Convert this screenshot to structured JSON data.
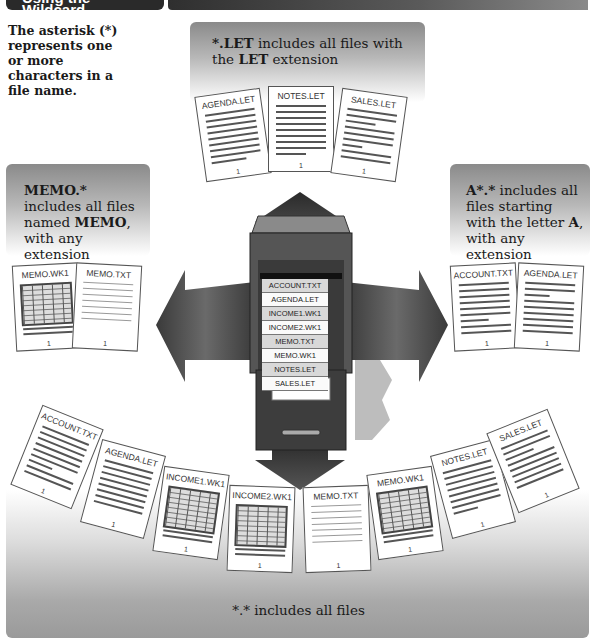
{
  "header": {
    "title": "Using the * Wildcard"
  },
  "intro": {
    "text": "The asterisk (*) represents one or more characters in a file name."
  },
  "callouts": {
    "top": {
      "bold1": "*.LET",
      "rest1": " includes all files with the ",
      "bold2": "LET",
      "rest2": " extension"
    },
    "left": {
      "bold1": "MEMO.*",
      "rest1": " includes all files named ",
      "bold2": "MEMO",
      "rest2": ", with any extension"
    },
    "right": {
      "bold1": "A*.*",
      "rest1": " includes all files starting with the letter ",
      "bold2": "A",
      "rest2": ", with any extension"
    },
    "bottom": {
      "text": "*.* includes all files"
    }
  },
  "cabinet": {
    "files": [
      "ACCOUNT.TXT",
      "AGENDA.LET",
      "INCOME1.WK1",
      "INCOME2.WK1",
      "MEMO.TXT",
      "MEMO.WK1",
      "NOTES.LET",
      "SALES.LET"
    ]
  },
  "groups": {
    "top": [
      {
        "name": "AGENDA.LET",
        "page": "1"
      },
      {
        "name": "NOTES.LET",
        "page": "1"
      },
      {
        "name": "SALES.LET",
        "page": "1"
      }
    ],
    "left": [
      {
        "name": "MEMO.WK1",
        "page": "1"
      },
      {
        "name": "MEMO.TXT",
        "page": "1"
      }
    ],
    "right": [
      {
        "name": "ACCOUNT.TXT",
        "page": "1"
      },
      {
        "name": "AGENDA.LET",
        "page": "1"
      }
    ],
    "bottom": [
      {
        "name": "ACCOUNT.TXT",
        "page": "1"
      },
      {
        "name": "AGENDA.LET",
        "page": "1"
      },
      {
        "name": "INCOME1.WK1",
        "page": "1"
      },
      {
        "name": "INCOME2.WK1",
        "page": "1"
      },
      {
        "name": "MEMO.TXT",
        "page": "1"
      },
      {
        "name": "MEMO.WK1",
        "page": "1"
      },
      {
        "name": "NOTES.LET",
        "page": "1"
      },
      {
        "name": "SALES.LET",
        "page": "1"
      }
    ]
  }
}
